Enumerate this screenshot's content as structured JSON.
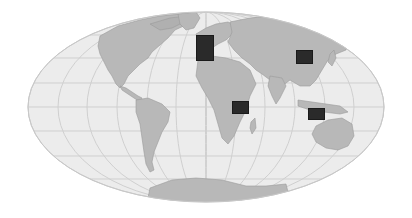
{
  "map": {
    "projection": "mollweide-like",
    "style": "grayscale",
    "colors": {
      "background": "#ffffff",
      "ocean": "#ececec",
      "land": "#b8b8b8",
      "land_stroke": "#9a9a9a",
      "graticule": "#cfcfcf",
      "outline": "#c8c8c8",
      "marker": "#2a2a2a"
    },
    "markers": [
      {
        "id": "europe",
        "label": "",
        "x": 196,
        "y": 35,
        "w": 18,
        "h": 26
      },
      {
        "id": "east-asia",
        "label": "",
        "x": 296,
        "y": 50,
        "w": 17,
        "h": 14
      },
      {
        "id": "east-africa",
        "label": "",
        "x": 232,
        "y": 101,
        "w": 17,
        "h": 13
      },
      {
        "id": "southeast-asia",
        "label": "",
        "x": 308,
        "y": 108,
        "w": 17,
        "h": 12
      }
    ]
  }
}
